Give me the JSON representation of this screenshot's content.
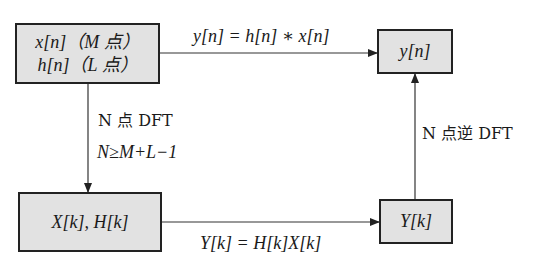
{
  "diagram": {
    "title": "",
    "nodes": {
      "input": {
        "line1": "x[n]（M 点）",
        "line2": "h[n]（L 点）"
      },
      "output_time": {
        "label": "y[n]"
      },
      "freq_input": {
        "label": "X[k], H[k]"
      },
      "output_freq": {
        "label": "Y[k]"
      }
    },
    "edges": {
      "top": {
        "label": "y[n] = h[n] ∗ x[n]",
        "from": "input",
        "to": "output_time"
      },
      "left": {
        "line1": "N 点 DFT",
        "line2": "N≥M+L−1",
        "from": "input",
        "to": "freq_input"
      },
      "bottom": {
        "label": "Y[k] = H[k]X[k]",
        "from": "freq_input",
        "to": "output_freq"
      },
      "right": {
        "label": "N 点逆 DFT",
        "from": "output_freq",
        "to": "output_time"
      }
    },
    "colors": {
      "box_fill": "#e2e2e2",
      "line": "#222222"
    }
  }
}
